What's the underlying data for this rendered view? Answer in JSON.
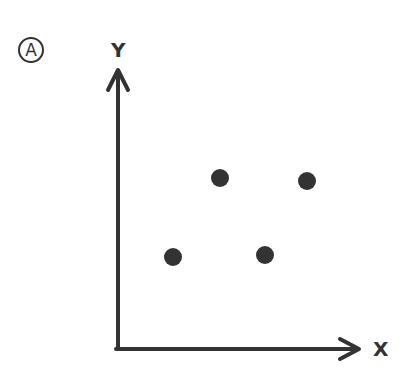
{
  "panel_label": "A",
  "axes": {
    "y_label": "Y",
    "x_label": "X"
  },
  "colors": {
    "ink": "#333333",
    "dot": "#333333",
    "background": "#ffffff"
  },
  "chart_data": {
    "type": "scatter",
    "title": "",
    "xlabel": "X",
    "ylabel": "Y",
    "grid": false,
    "ticks": false,
    "points": [
      {
        "x": 173,
        "y": 257
      },
      {
        "x": 220,
        "y": 178
      },
      {
        "x": 265,
        "y": 255
      },
      {
        "x": 307,
        "y": 181
      }
    ]
  }
}
